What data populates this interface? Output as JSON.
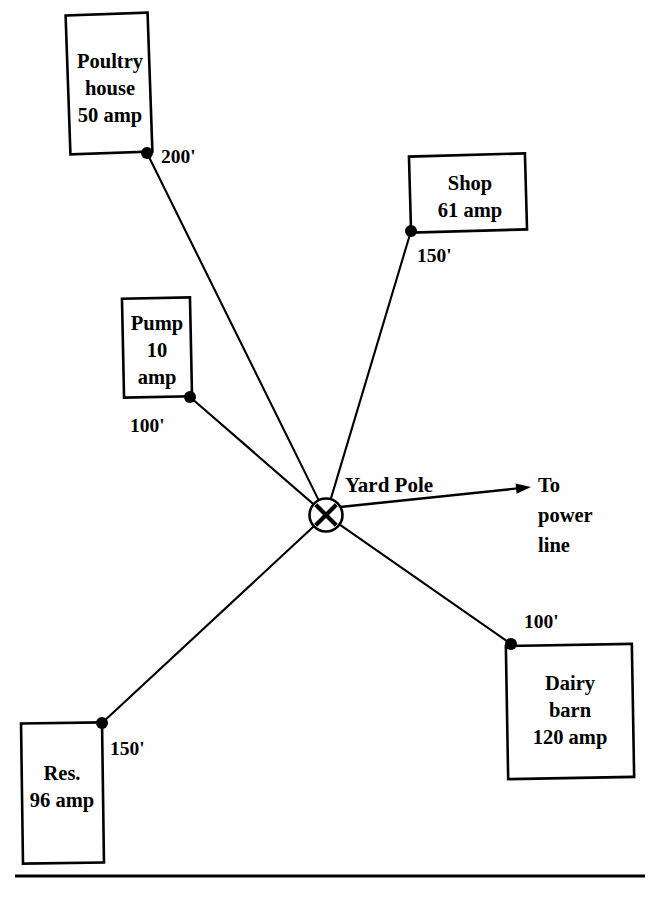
{
  "diagram": {
    "background_color": "#fefefe",
    "stroke_color": "#000000",
    "center_node": {
      "label": "Yard Pole",
      "symbol": "circle-with-x",
      "x": 326,
      "y": 515,
      "radius": 16.5,
      "label_x": 345,
      "label_y": 492
    },
    "service_entrance": {
      "label_line1": "To",
      "label_line2": "power",
      "label_line3": "line",
      "arrow_from_x": 340,
      "arrow_from_y": 507,
      "arrow_to_x": 531,
      "arrow_to_y": 487,
      "label_x": 538,
      "label_y": 492,
      "line_height": 30
    },
    "baseline": {
      "x1": 15,
      "y1": 876,
      "x2": 645,
      "y2": 876
    },
    "buildings": [
      {
        "id": "poultry-house",
        "name_line1": "Poultry",
        "name_line2": "house",
        "name_line3": "50 amp",
        "load_amps": 50,
        "distance": "200'",
        "box_x": 68,
        "box_y": 14,
        "box_w": 82,
        "box_h": 139,
        "skew": -2.0,
        "text_x": 110,
        "text_y": 68,
        "tap_x": 147,
        "tap_y": 153,
        "dist_x": 161,
        "dist_y": 163
      },
      {
        "id": "shop",
        "name_line1": "Shop",
        "name_line2": "61 amp",
        "name_line3": "",
        "load_amps": 61,
        "distance": "150'",
        "box_x": 410,
        "box_y": 155,
        "box_w": 116,
        "box_h": 76,
        "skew": -1.6,
        "text_x": 470,
        "text_y": 190,
        "tap_x": 411,
        "tap_y": 231,
        "dist_x": 417,
        "dist_y": 262
      },
      {
        "id": "pump",
        "name_line1": "Pump",
        "name_line2": "10",
        "name_line3": "amp",
        "load_amps": 10,
        "distance": "100'",
        "box_x": 123,
        "box_y": 298,
        "box_w": 68,
        "box_h": 99,
        "skew": -1.2,
        "text_x": 157,
        "text_y": 330,
        "tap_x": 190,
        "tap_y": 397,
        "dist_x": 130,
        "dist_y": 432
      },
      {
        "id": "dairy-barn",
        "name_line1": "Dairy",
        "name_line2": "barn",
        "name_line3": "120 amp",
        "load_amps": 120,
        "distance": "100'",
        "box_x": 507,
        "box_y": 645,
        "box_w": 126,
        "box_h": 133,
        "skew": -1.0,
        "text_x": 570,
        "text_y": 690,
        "tap_x": 511,
        "tap_y": 644,
        "dist_x": 524,
        "dist_y": 628
      },
      {
        "id": "res",
        "name_line1": "Res.",
        "name_line2": "96 amp",
        "name_line3": "",
        "load_amps": 96,
        "distance": "150'",
        "box_x": 22,
        "box_y": 723,
        "box_w": 81,
        "box_h": 140,
        "skew": -0.8,
        "text_x": 62,
        "text_y": 780,
        "tap_x": 102,
        "tap_y": 723,
        "dist_x": 110,
        "dist_y": 755
      }
    ]
  }
}
